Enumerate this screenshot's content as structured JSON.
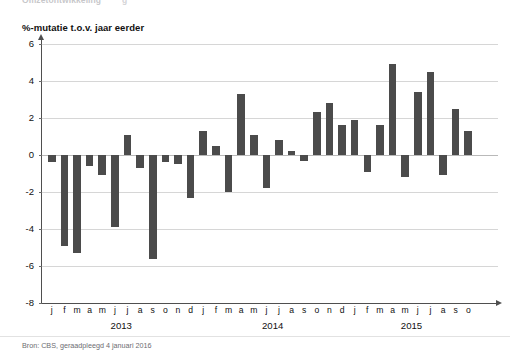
{
  "page": {
    "cutoff_headline": "Omzetontwikkeling",
    "cutoff_fragment": "g"
  },
  "chart_data": {
    "type": "bar",
    "title": "%-mutatie t.o.v. jaar eerder",
    "subtitle": "",
    "xlabel": "",
    "ylabel": "%-mutatie t.o.v. jaar eerder",
    "ylim": [
      -8,
      6
    ],
    "yticks": [
      6,
      4,
      2,
      0,
      -2,
      -4,
      -6,
      -8
    ],
    "ytick_labels": [
      "6",
      "4",
      "2",
      "0",
      "-2",
      "-4",
      "-6",
      "-8"
    ],
    "grid": true,
    "legend": false,
    "bar_color": "#4b4b4b",
    "gridline_color": "#d6d6d6",
    "axis_color": "#4f4f4f",
    "source_note": "Bron: CBS, geraadpleegd 4 januari 2016",
    "year_groups": [
      {
        "label": "2013",
        "start_index": 0,
        "count": 12
      },
      {
        "label": "2014",
        "start_index": 12,
        "count": 12
      },
      {
        "label": "2015",
        "start_index": 24,
        "count": 10
      }
    ],
    "categories": [
      "j",
      "f",
      "m",
      "a",
      "m",
      "j",
      "j",
      "a",
      "s",
      "o",
      "n",
      "d",
      "j",
      "f",
      "m",
      "a",
      "m",
      "j",
      "j",
      "a",
      "s",
      "o",
      "n",
      "d",
      "j",
      "f",
      "m",
      "a",
      "m",
      "j",
      "j",
      "a",
      "s",
      "o"
    ],
    "values": [
      -0.4,
      -4.9,
      -5.3,
      -0.6,
      -1.1,
      -3.9,
      1.1,
      -0.7,
      -5.6,
      -0.4,
      -0.5,
      -2.3,
      1.3,
      0.5,
      -2.0,
      3.3,
      1.1,
      -1.8,
      0.8,
      0.2,
      -0.3,
      2.3,
      2.8,
      1.6,
      1.9,
      -0.9,
      1.6,
      4.9,
      -1.2,
      3.4,
      4.5,
      -1.1,
      2.5,
      1.3
    ]
  }
}
